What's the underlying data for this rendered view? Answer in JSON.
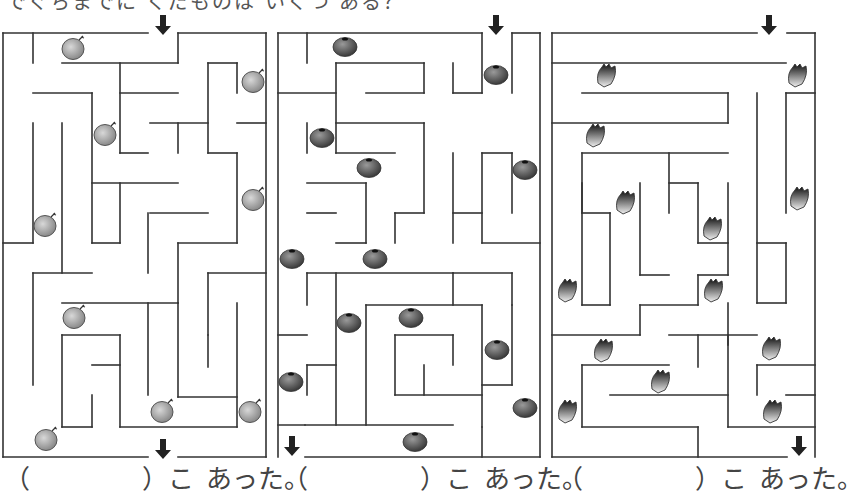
{
  "question": "でぐちまでに くだものは いくつ ある？",
  "answer_template": {
    "open": "（",
    "close": "）こ",
    "suffix": "あった。"
  },
  "colors": {
    "wall": "#333333",
    "melon": "#9a9a9a",
    "berry": "#6a6a6a",
    "pine": "#222222"
  },
  "mazes": [
    {
      "name": "melon-maze",
      "fruit": "melon",
      "fruit_count_visible": 9,
      "walls": [
        [
          3,
          33,
          148,
          33
        ],
        [
          178,
          33,
          266,
          33
        ],
        [
          3,
          33,
          3,
          457
        ],
        [
          266,
          33,
          266,
          457
        ],
        [
          3,
          457,
          148,
          457
        ],
        [
          178,
          457,
          266,
          457
        ],
        [
          33,
          33,
          33,
          63
        ],
        [
          62,
          63,
          178,
          63
        ],
        [
          178,
          33,
          178,
          63
        ],
        [
          33,
          93,
          92,
          93
        ],
        [
          92,
          93,
          92,
          243
        ],
        [
          120,
          63,
          120,
          153
        ],
        [
          120,
          93,
          178,
          93
        ],
        [
          208,
          63,
          237,
          63
        ],
        [
          208,
          63,
          208,
          153
        ],
        [
          237,
          63,
          237,
          93
        ],
        [
          237,
          123,
          266,
          123
        ],
        [
          150,
          123,
          208,
          123
        ],
        [
          178,
          123,
          178,
          153
        ],
        [
          120,
          153,
          148,
          153
        ],
        [
          33,
          123,
          33,
          243
        ],
        [
          3,
          243,
          33,
          243
        ],
        [
          62,
          123,
          62,
          273
        ],
        [
          92,
          183,
          178,
          183
        ],
        [
          208,
          153,
          237,
          153
        ],
        [
          237,
          153,
          237,
          243
        ],
        [
          150,
          213,
          208,
          213
        ],
        [
          148,
          213,
          148,
          273
        ],
        [
          120,
          183,
          120,
          243
        ],
        [
          92,
          243,
          120,
          243
        ],
        [
          178,
          243,
          237,
          243
        ],
        [
          178,
          243,
          178,
          303
        ],
        [
          208,
          273,
          266,
          273
        ],
        [
          208,
          273,
          208,
          335
        ],
        [
          33,
          273,
          92,
          273
        ],
        [
          33,
          273,
          33,
          385
        ],
        [
          62,
          303,
          178,
          303
        ],
        [
          148,
          303,
          148,
          395
        ],
        [
          62,
          335,
          120,
          335
        ],
        [
          62,
          335,
          62,
          427
        ],
        [
          62,
          427,
          92,
          427
        ],
        [
          92,
          395,
          92,
          427
        ],
        [
          92,
          365,
          120,
          365
        ],
        [
          120,
          335,
          120,
          427
        ],
        [
          120,
          427,
          237,
          427
        ],
        [
          178,
          303,
          178,
          397
        ],
        [
          178,
          397,
          237,
          397
        ],
        [
          237,
          303,
          237,
          427
        ],
        [
          208,
          335,
          208,
          367
        ]
      ],
      "fruits": [
        [
          73,
          49
        ],
        [
          253,
          82
        ],
        [
          105,
          135
        ],
        [
          45,
          226
        ],
        [
          253,
          200
        ],
        [
          74,
          318
        ],
        [
          162,
          412
        ],
        [
          250,
          412
        ],
        [
          46,
          440
        ]
      ],
      "arrows": [
        [
          163,
          20
        ],
        [
          163,
          444
        ]
      ]
    },
    {
      "name": "blueberry-maze",
      "fruit": "blueberry",
      "fruit_count_visible": 13,
      "walls": [
        [
          278,
          33,
          482,
          33
        ],
        [
          512,
          33,
          540,
          33
        ],
        [
          278,
          33,
          278,
          457
        ],
        [
          540,
          33,
          540,
          457
        ],
        [
          305,
          457,
          540,
          457
        ],
        [
          307,
          33,
          307,
          63
        ],
        [
          278,
          93,
          336,
          93
        ],
        [
          336,
          63,
          336,
          153
        ],
        [
          336,
          63,
          424,
          63
        ],
        [
          424,
          63,
          424,
          93
        ],
        [
          366,
          93,
          424,
          93
        ],
        [
          453,
          63,
          453,
          93
        ],
        [
          453,
          93,
          482,
          93
        ],
        [
          482,
          33,
          482,
          93
        ],
        [
          512,
          33,
          512,
          93
        ],
        [
          336,
          123,
          424,
          123
        ],
        [
          424,
          123,
          424,
          213
        ],
        [
          336,
          153,
          395,
          153
        ],
        [
          307,
          123,
          307,
          153
        ],
        [
          307,
          183,
          366,
          183
        ],
        [
          366,
          183,
          366,
          243
        ],
        [
          307,
          213,
          336,
          213
        ],
        [
          336,
          243,
          366,
          243
        ],
        [
          395,
          213,
          424,
          213
        ],
        [
          395,
          213,
          395,
          243
        ],
        [
          453,
          153,
          453,
          243
        ],
        [
          453,
          213,
          482,
          213
        ],
        [
          482,
          153,
          512,
          153
        ],
        [
          482,
          153,
          482,
          243
        ],
        [
          482,
          243,
          540,
          243
        ],
        [
          512,
          153,
          512,
          213
        ],
        [
          307,
          273,
          453,
          273
        ],
        [
          307,
          273,
          307,
          305
        ],
        [
          336,
          273,
          336,
          425
        ],
        [
          453,
          273,
          512,
          273
        ],
        [
          453,
          273,
          453,
          305
        ],
        [
          512,
          273,
          512,
          305
        ],
        [
          366,
          305,
          482,
          305
        ],
        [
          366,
          305,
          366,
          425
        ],
        [
          482,
          305,
          482,
          427
        ],
        [
          512,
          305,
          512,
          385
        ],
        [
          482,
          385,
          512,
          385
        ],
        [
          395,
          335,
          453,
          335
        ],
        [
          395,
          335,
          395,
          395
        ],
        [
          395,
          395,
          482,
          395
        ],
        [
          424,
          365,
          424,
          395
        ],
        [
          453,
          335,
          453,
          365
        ],
        [
          278,
          335,
          307,
          335
        ],
        [
          307,
          365,
          336,
          365
        ],
        [
          307,
          365,
          307,
          395
        ],
        [
          278,
          425,
          453,
          425
        ],
        [
          482,
          427,
          482,
          457
        ],
        [
          305,
          425,
          305,
          425
        ]
      ],
      "fruits": [
        [
          345,
          47
        ],
        [
          496,
          75
        ],
        [
          322,
          138
        ],
        [
          369,
          168
        ],
        [
          525,
          170
        ],
        [
          292,
          259
        ],
        [
          375,
          259
        ],
        [
          349,
          323
        ],
        [
          411,
          318
        ],
        [
          497,
          350
        ],
        [
          291,
          382
        ],
        [
          525,
          408
        ],
        [
          415,
          442
        ]
      ],
      "arrows": [
        [
          496,
          20
        ],
        [
          292,
          441
        ]
      ]
    },
    {
      "name": "pineapple-maze",
      "fruit": "pineapple",
      "fruit_count_visible": 14,
      "walls": [
        [
          552,
          33,
          757,
          33
        ],
        [
          787,
          33,
          815,
          33
        ],
        [
          552,
          33,
          552,
          457
        ],
        [
          815,
          33,
          815,
          457
        ],
        [
          552,
          457,
          787,
          457
        ],
        [
          552,
          63,
          786,
          63
        ],
        [
          582,
          93,
          728,
          93
        ],
        [
          728,
          93,
          728,
          123
        ],
        [
          552,
          123,
          728,
          123
        ],
        [
          757,
          93,
          757,
          303
        ],
        [
          786,
          93,
          815,
          93
        ],
        [
          786,
          93,
          786,
          213
        ],
        [
          582,
          153,
          728,
          153
        ],
        [
          582,
          153,
          582,
          213
        ],
        [
          669,
          153,
          669,
          213
        ],
        [
          582,
          213,
          610,
          213
        ],
        [
          610,
          213,
          610,
          305
        ],
        [
          582,
          183,
          582,
          305
        ],
        [
          582,
          305,
          610,
          305
        ],
        [
          640,
          183,
          640,
          275
        ],
        [
          669,
          183,
          698,
          183
        ],
        [
          698,
          183,
          698,
          243
        ],
        [
          698,
          243,
          728,
          243
        ],
        [
          728,
          183,
          728,
          275
        ],
        [
          698,
          275,
          728,
          275
        ],
        [
          698,
          275,
          698,
          305
        ],
        [
          757,
          243,
          786,
          243
        ],
        [
          786,
          243,
          786,
          303
        ],
        [
          757,
          303,
          786,
          303
        ],
        [
          640,
          275,
          669,
          275
        ],
        [
          640,
          305,
          698,
          305
        ],
        [
          728,
          303,
          728,
          345
        ],
        [
          640,
          305,
          640,
          335
        ],
        [
          552,
          335,
          640,
          335
        ],
        [
          669,
          335,
          757,
          335
        ],
        [
          698,
          335,
          698,
          367
        ],
        [
          728,
          335,
          728,
          427
        ],
        [
          757,
          365,
          815,
          365
        ],
        [
          757,
          365,
          757,
          395
        ],
        [
          786,
          395,
          815,
          395
        ],
        [
          582,
          365,
          669,
          365
        ],
        [
          582,
          365,
          582,
          427
        ],
        [
          610,
          395,
          728,
          395
        ],
        [
          582,
          427,
          698,
          427
        ],
        [
          698,
          427,
          698,
          457
        ],
        [
          728,
          427,
          815,
          427
        ]
      ],
      "fruits": [
        [
          606,
          77
        ],
        [
          797,
          77
        ],
        [
          595,
          137
        ],
        [
          625,
          204
        ],
        [
          799,
          200
        ],
        [
          712,
          230
        ],
        [
          567,
          292
        ],
        [
          713,
          292
        ],
        [
          603,
          352
        ],
        [
          660,
          383
        ],
        [
          771,
          350
        ],
        [
          567,
          413
        ],
        [
          772,
          413
        ]
      ],
      "arrows": [
        [
          769,
          20
        ],
        [
          799,
          441
        ]
      ]
    }
  ],
  "answers": [
    {
      "left": 4,
      "label": "answer-blank-1"
    },
    {
      "left": 282,
      "label": "answer-blank-2"
    },
    {
      "left": 557,
      "label": "answer-blank-3"
    }
  ]
}
